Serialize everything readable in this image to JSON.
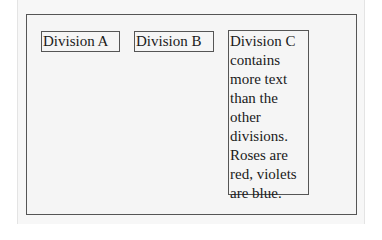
{
  "divisions": [
    {
      "label": "Division A"
    },
    {
      "label": "Division B"
    },
    {
      "label": "Division C contains more text than the other divisions. Roses are red, violets are blue."
    }
  ]
}
